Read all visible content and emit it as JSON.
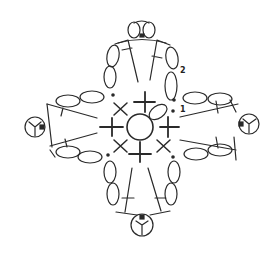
{
  "diagram": {
    "type": "crochet-chart",
    "stroke_color": "#2a2a2a",
    "background": "#ffffff",
    "round_labels": [
      {
        "id": "round-1",
        "text": "1"
      },
      {
        "id": "round-2",
        "text": "2"
      }
    ],
    "symbols": {
      "center": "magic-ring",
      "round1": [
        "single-crochet",
        "single-crochet",
        "single-crochet",
        "single-crochet",
        "x-stitch",
        "x-stitch",
        "x-stitch",
        "x-stitch"
      ],
      "petals": [
        "top",
        "right",
        "bottom",
        "left"
      ],
      "petal_components": [
        "chain-oval",
        "treble-crochet",
        "picot"
      ]
    }
  }
}
